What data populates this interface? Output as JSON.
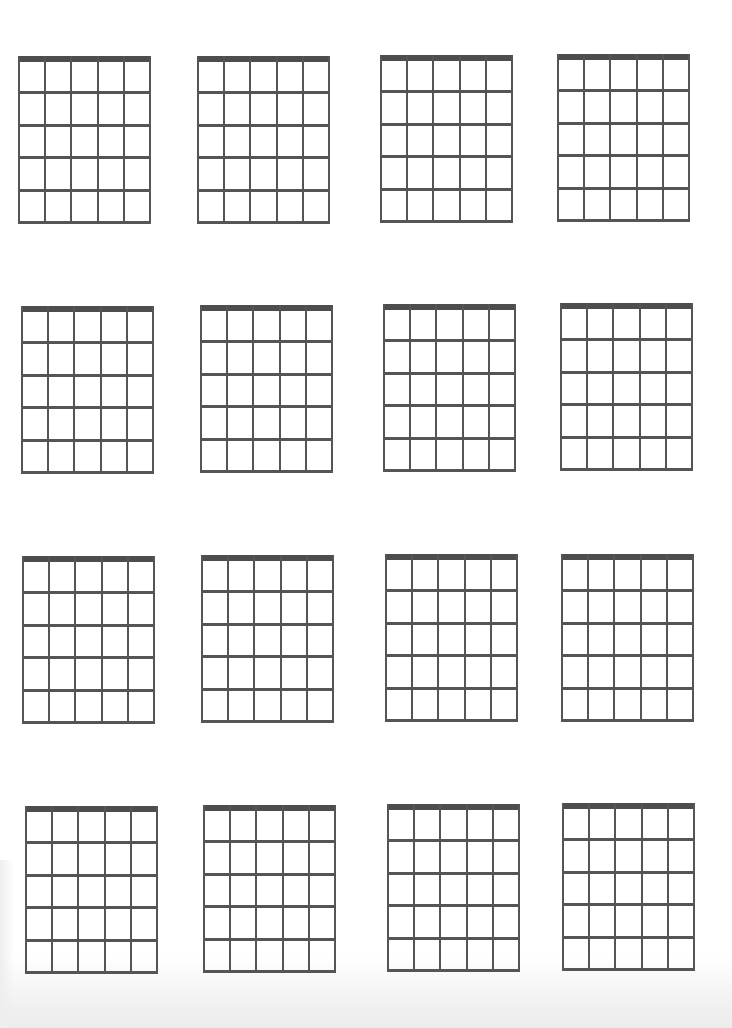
{
  "document": {
    "title": "Blank guitar chord diagrams",
    "layout": {
      "rows": 4,
      "columns": 4
    },
    "diagram": {
      "strings": 6,
      "frets": 5,
      "has_nut": true
    },
    "line_color": "#555555",
    "nut_color": "#4d4d4d",
    "background_color": "#ffffff",
    "chords": [
      {
        "row": 1,
        "col": 1,
        "name": "",
        "markers": []
      },
      {
        "row": 1,
        "col": 2,
        "name": "",
        "markers": []
      },
      {
        "row": 1,
        "col": 3,
        "name": "",
        "markers": []
      },
      {
        "row": 1,
        "col": 4,
        "name": "",
        "markers": []
      },
      {
        "row": 2,
        "col": 1,
        "name": "",
        "markers": []
      },
      {
        "row": 2,
        "col": 2,
        "name": "",
        "markers": []
      },
      {
        "row": 2,
        "col": 3,
        "name": "",
        "markers": []
      },
      {
        "row": 2,
        "col": 4,
        "name": "",
        "markers": []
      },
      {
        "row": 3,
        "col": 1,
        "name": "",
        "markers": []
      },
      {
        "row": 3,
        "col": 2,
        "name": "",
        "markers": []
      },
      {
        "row": 3,
        "col": 3,
        "name": "",
        "markers": []
      },
      {
        "row": 3,
        "col": 4,
        "name": "",
        "markers": []
      },
      {
        "row": 4,
        "col": 1,
        "name": "",
        "markers": []
      },
      {
        "row": 4,
        "col": 2,
        "name": "",
        "markers": []
      },
      {
        "row": 4,
        "col": 3,
        "name": "",
        "markers": []
      },
      {
        "row": 4,
        "col": 4,
        "name": "",
        "markers": []
      }
    ]
  }
}
